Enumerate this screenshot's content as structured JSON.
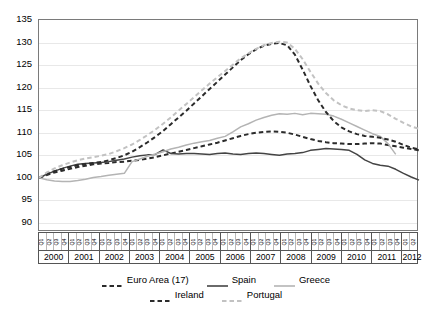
{
  "chart_data": {
    "type": "line",
    "title": "",
    "subtitle": "",
    "xlabel": "",
    "ylabel": "",
    "ylim": [
      88,
      135
    ],
    "yticks": [
      90,
      95,
      100,
      105,
      110,
      115,
      120,
      125,
      130,
      135
    ],
    "grid": true,
    "legend_position": "bottom",
    "x_years": [
      2000,
      2001,
      2002,
      2003,
      2004,
      2005,
      2006,
      2007,
      2008,
      2009,
      2010,
      2011,
      2012
    ],
    "x_quarters": [
      "Q1",
      "Q2",
      "Q3",
      "Q4"
    ],
    "x": [
      "2000Q1",
      "2000Q2",
      "2000Q3",
      "2000Q4",
      "2001Q1",
      "2001Q2",
      "2001Q3",
      "2001Q4",
      "2002Q1",
      "2002Q2",
      "2002Q3",
      "2002Q4",
      "2003Q1",
      "2003Q2",
      "2003Q3",
      "2003Q4",
      "2004Q1",
      "2004Q2",
      "2004Q3",
      "2004Q4",
      "2005Q1",
      "2005Q2",
      "2005Q3",
      "2005Q4",
      "2006Q1",
      "2006Q2",
      "2006Q3",
      "2006Q4",
      "2007Q1",
      "2007Q2",
      "2007Q3",
      "2007Q4",
      "2008Q1",
      "2008Q2",
      "2008Q3",
      "2008Q4",
      "2009Q1",
      "2009Q2",
      "2009Q3",
      "2009Q4",
      "2010Q1",
      "2010Q2",
      "2010Q3",
      "2010Q4",
      "2011Q1",
      "2011Q2",
      "2011Q3",
      "2011Q4",
      "2012Q1",
      "2012Q2"
    ],
    "series": [
      {
        "name": "Euro Area (17)",
        "color": "#2b2b2b",
        "style": "dashed",
        "width": 2.0,
        "values": [
          100.0,
          100.6,
          101.2,
          101.6,
          102.0,
          102.4,
          102.7,
          103.0,
          103.2,
          103.3,
          103.5,
          103.6,
          103.8,
          104.0,
          104.3,
          104.6,
          105.0,
          105.4,
          105.8,
          106.2,
          106.6,
          107.0,
          107.4,
          107.8,
          108.3,
          108.8,
          109.3,
          109.7,
          110.0,
          110.2,
          110.3,
          110.2,
          110.0,
          109.6,
          109.1,
          108.6,
          108.2,
          107.9,
          107.7,
          107.6,
          107.5,
          107.5,
          107.6,
          107.7,
          107.6,
          107.3,
          107.0,
          106.7,
          106.4,
          106.1
        ]
      },
      {
        "name": "Spain",
        "color": "#444444",
        "style": "solid",
        "width": 1.5,
        "values": [
          100.0,
          100.8,
          101.5,
          102.1,
          102.6,
          103.0,
          103.2,
          103.3,
          103.4,
          103.6,
          103.9,
          104.2,
          104.6,
          104.9,
          105.1,
          105.2,
          106.2,
          105.4,
          105.3,
          105.4,
          105.4,
          105.3,
          105.2,
          105.4,
          105.5,
          105.3,
          105.2,
          105.4,
          105.5,
          105.4,
          105.2,
          105.0,
          105.3,
          105.4,
          105.6,
          106.1,
          106.3,
          106.5,
          106.4,
          106.3,
          106.1,
          105.2,
          104.0,
          103.2,
          102.8,
          102.6,
          101.9,
          101.0,
          100.2,
          99.5
        ]
      },
      {
        "name": "Greece",
        "color": "#b4b4b4",
        "style": "solid",
        "width": 1.5,
        "values": [
          100.0,
          99.6,
          99.3,
          99.2,
          99.2,
          99.4,
          99.7,
          100.1,
          100.3,
          100.6,
          100.8,
          101.0,
          103.6,
          104.2,
          104.8,
          105.3,
          105.8,
          106.4,
          106.8,
          107.3,
          107.7,
          108.0,
          108.3,
          108.8,
          109.2,
          110.2,
          111.3,
          112.0,
          112.8,
          113.4,
          113.9,
          114.2,
          114.1,
          114.3,
          114.0,
          114.3,
          114.2,
          114.1,
          113.7,
          113.0,
          112.2,
          111.4,
          110.6,
          109.8,
          109.2,
          107.6,
          105.2,
          null,
          null,
          null
        ]
      },
      {
        "name": "Ireland",
        "color": "#2b2b2b",
        "style": "dashed",
        "width": 2.0,
        "values": [
          100.0,
          100.9,
          101.5,
          102.0,
          102.4,
          102.8,
          103.1,
          103.3,
          103.5,
          103.9,
          104.4,
          105.0,
          105.8,
          106.8,
          107.9,
          109.1,
          110.4,
          111.9,
          113.4,
          114.9,
          116.5,
          118.1,
          119.7,
          121.3,
          122.9,
          124.5,
          126.1,
          127.4,
          128.5,
          129.3,
          129.7,
          129.9,
          129.4,
          127.3,
          124.0,
          120.4,
          117.2,
          114.6,
          112.6,
          111.2,
          110.3,
          109.7,
          109.3,
          109.1,
          108.9,
          108.5,
          108.0,
          107.3,
          106.7,
          106.3
        ]
      },
      {
        "name": "Portugal",
        "color": "#c2c2c2",
        "style": "dashed",
        "width": 2.0,
        "values": [
          100.0,
          101.2,
          102.1,
          102.8,
          103.4,
          103.9,
          104.3,
          104.6,
          104.9,
          105.3,
          105.9,
          106.6,
          107.4,
          108.4,
          109.5,
          110.7,
          112.0,
          113.4,
          114.9,
          116.4,
          117.9,
          119.4,
          120.9,
          122.3,
          123.7,
          125.1,
          126.5,
          127.6,
          128.6,
          129.4,
          129.9,
          130.2,
          130.0,
          128.6,
          126.3,
          123.5,
          120.9,
          118.8,
          117.2,
          116.1,
          115.4,
          115.0,
          114.8,
          115.0,
          114.8,
          114.1,
          113.1,
          112.2,
          111.4,
          110.9
        ]
      }
    ]
  },
  "axis": {
    "yticks": [
      "135",
      "130",
      "125",
      "120",
      "115",
      "110",
      "105",
      "100",
      "95",
      "90"
    ],
    "years": [
      "2000",
      "2001",
      "2002",
      "2003",
      "2004",
      "2005",
      "2006",
      "2007",
      "2008",
      "2009",
      "2010",
      "2011",
      "2012"
    ],
    "quarters": [
      "Q1",
      "Q2",
      "Q3",
      "Q4"
    ]
  },
  "legend": {
    "row1": [
      {
        "label": "Euro Area (17)",
        "color": "#2b2b2b",
        "style": "dashed"
      },
      {
        "label": "Spain",
        "color": "#444444",
        "style": "solid"
      },
      {
        "label": "Greece",
        "color": "#b4b4b4",
        "style": "solid"
      }
    ],
    "row2": [
      {
        "label": "Ireland",
        "color": "#2b2b2b",
        "style": "dashed"
      },
      {
        "label": "Portugal",
        "color": "#c2c2c2",
        "style": "dashed"
      }
    ]
  }
}
